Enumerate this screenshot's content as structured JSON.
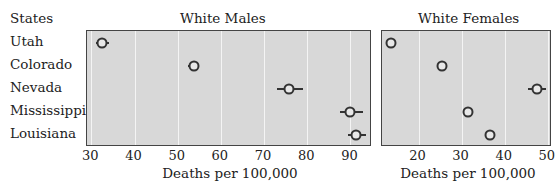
{
  "chart_data": [
    {
      "type": "scatter",
      "title": "White Males",
      "xlabel": "Deaths per 100,000",
      "ylabel": "States",
      "xlim": [
        29,
        95
      ],
      "xticks": [
        30,
        40,
        50,
        60,
        70,
        80,
        90
      ],
      "grid": true,
      "categories": [
        "Utah",
        "Colorado",
        "Nevada",
        "Mississippi",
        "Louisiana"
      ],
      "values": [
        32.5,
        53.8,
        75.7,
        90.0,
        91.3
      ],
      "ci_low": [
        31.0,
        52.5,
        73.0,
        87.5,
        89.5
      ],
      "ci_high": [
        34.0,
        55.0,
        79.0,
        93.0,
        93.5
      ]
    },
    {
      "type": "scatter",
      "title": "White Females",
      "xlabel": "Deaths per 100,000",
      "ylabel": "States",
      "xlim": [
        11.5,
        51
      ],
      "xticks": [
        20,
        30,
        40,
        50
      ],
      "grid": true,
      "categories": [
        "Utah",
        "Colorado",
        "Nevada",
        "Mississippi",
        "Louisiana"
      ],
      "values": [
        13.5,
        25.5,
        47.5,
        31.5,
        36.5
      ],
      "ci_low": [
        13.0,
        25.0,
        45.5,
        30.5,
        36.0
      ],
      "ci_high": [
        14.0,
        26.0,
        49.5,
        32.5,
        37.0
      ]
    }
  ],
  "labels": {
    "states_header": "States",
    "males_title": "White Males",
    "females_title": "White Females",
    "xlabel_left": "Deaths per 100,000",
    "xlabel_right": "Deaths per 100,000"
  },
  "states": [
    "Utah",
    "Colorado",
    "Nevada",
    "Mississippi",
    "Louisiana"
  ],
  "colors": {
    "panel_bg": "#d8d8d8",
    "grid": "#f4f4f4",
    "marker": "#333333",
    "border": "#444444"
  }
}
